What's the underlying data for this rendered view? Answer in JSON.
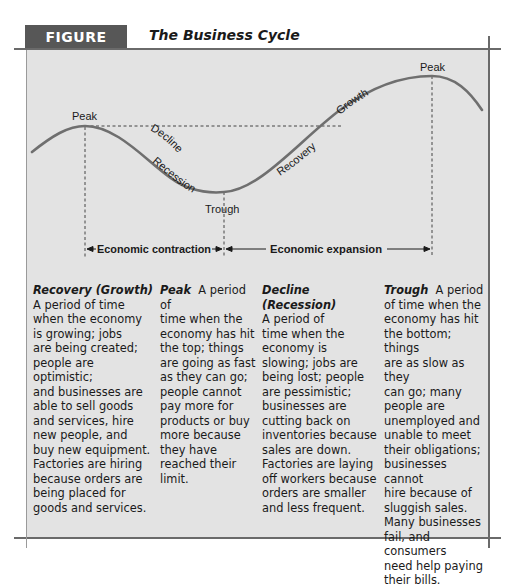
{
  "figure": {
    "label": "FIGURE 25.1",
    "title": "The Business Cycle",
    "label_bg": "#575757",
    "panel_bg": "#e3e3e3"
  },
  "diagram": {
    "curve_labels": {
      "peak_left": "Peak",
      "peak_right": "Peak",
      "decline": "Decline",
      "recession": "Recession",
      "trough": "Trough",
      "recovery": "Recovery",
      "growth": "Growth"
    },
    "phases": {
      "contraction": "Economic contraction",
      "expansion": "Economic expansion"
    }
  },
  "definitions": [
    {
      "term": "Recovery (Growth)",
      "text": "A period of time\nwhen the economy\nis growing; jobs\nare being created;\npeople are optimistic;\nand businesses are\nable to sell goods\nand services, hire\nnew people, and\nbuy new equipment.\nFactories are hiring\nbecause orders are\nbeing placed for\ngoods and services."
    },
    {
      "term": "Peak",
      "text": "A period of\ntime when the\neconomy has hit\nthe top; things\nare going as fast\nas they can go;\npeople cannot\npay more for\nproducts or buy\nmore because\nthey have\nreached their\nlimit."
    },
    {
      "term": "Decline (Recession)",
      "text": "A period of\ntime when the\neconomy is\nslowing; jobs are\nbeing lost; people\nare pessimistic;\nbusinesses are\ncutting back on\ninventories because\nsales are down.\nFactories are laying\noff workers because\norders are smaller\nand less frequent."
    },
    {
      "term": "Trough",
      "text": "A period\nof time when the\neconomy has hit\nthe bottom; things\nare as slow as they\ncan go; many\npeople are\nunemployed and\nunable to meet\ntheir obligations;\nbusinesses cannot\nhire because of\nsluggish sales.\nMany businesses\nfail, and consumers\nneed help paying\ntheir bills."
    }
  ]
}
